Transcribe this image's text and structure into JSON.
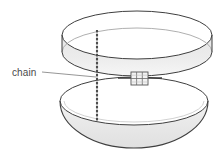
{
  "figure": {
    "name": "sphere-halves-with-chain-diagram",
    "labels": [
      {
        "id": "chain-label",
        "text": "chain",
        "x": 12,
        "y": 68,
        "leader_from": [
          42,
          72
        ],
        "leader_to": [
          96,
          77
        ]
      }
    ],
    "parts": {
      "upper_hemisphere": "upper-half-shell",
      "lower_hemisphere": "lower-half-shell",
      "chain": "vertical-beaded-chain",
      "clasp": "hinge-clasp-box"
    },
    "geometry": {
      "upper": {
        "rim_cx": 137,
        "rim_cy": 52,
        "rim_rx": 75,
        "rim_ry": 24,
        "top_cx": 137,
        "top_cy": 35,
        "top_rx": 75,
        "top_ry": 24
      },
      "lower": {
        "rim_cx": 134,
        "rim_cy": 101,
        "rim_rx": 74,
        "rim_ry": 24,
        "body_depth": 47
      },
      "chain": {
        "x": 97,
        "y_top": 30,
        "y_bottom": 121,
        "bead_count": 23
      },
      "clasp": {
        "x": 131,
        "y": 72,
        "w": 17,
        "h": 13,
        "cols": 3,
        "rows": 2
      }
    },
    "colors": {
      "background": "#ffffff",
      "outline": "#3c3c3c",
      "outline_light": "#8a8a8a",
      "shade_fill": "#ebebeb",
      "shade_fill_dark": "#e2e2e2",
      "label_text": "#4a4a4a",
      "leader_line": "#8a8a8a",
      "chain": "#5a5a5a",
      "clasp_fill": "#f2f2f2",
      "clasp_stroke": "#555555"
    }
  }
}
